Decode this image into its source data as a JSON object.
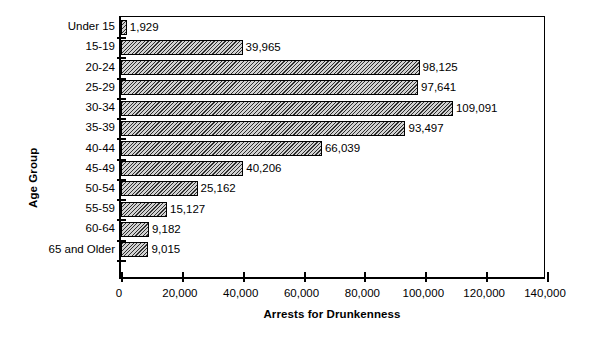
{
  "chart_data": {
    "type": "bar",
    "orientation": "horizontal",
    "title": "",
    "xlabel": "Arrests for Drunkenness",
    "ylabel": "Age Group",
    "categories": [
      "Under 15",
      "15-19",
      "20-24",
      "25-29",
      "30-34",
      "35-39",
      "40-44",
      "45-49",
      "50-54",
      "55-59",
      "60-64",
      "65 and Older"
    ],
    "values": [
      1929,
      39965,
      98125,
      97641,
      109091,
      93497,
      66039,
      40206,
      25162,
      15127,
      9182,
      9015
    ],
    "value_labels": [
      "1,929",
      "39,965",
      "98,125",
      "97,641",
      "109,091",
      "93,497",
      "66,039",
      "40,206",
      "25,162",
      "15,127",
      "9,182",
      "9,015"
    ],
    "xlim": [
      0,
      140000
    ],
    "xticks": [
      0,
      20000,
      40000,
      60000,
      80000,
      100000,
      120000,
      140000
    ],
    "xtick_labels": [
      "0",
      "20,000",
      "40,000",
      "60,000",
      "80,000",
      "100,000",
      "120,000",
      "140,000"
    ],
    "grid": false,
    "legend": null,
    "bar_fill": "#d2d2d2",
    "bar_hatch": "diagonal",
    "bar_edge_color": "#000000",
    "background": "#ffffff"
  }
}
